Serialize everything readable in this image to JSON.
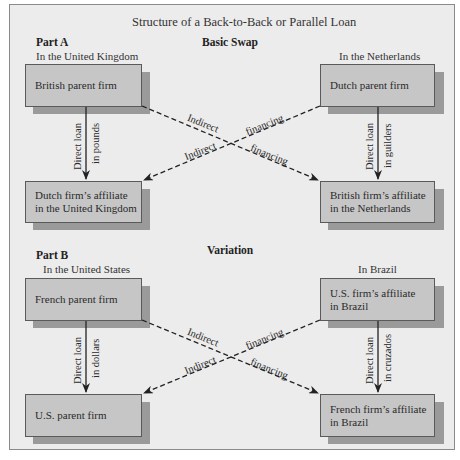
{
  "title": "Structure of a Back-to-Back or Parallel Loan",
  "part_a": {
    "label": "Part A",
    "heading": "Basic Swap",
    "left_location": "In the United Kingdom",
    "right_location": "In the Netherlands",
    "boxes": {
      "top_left": "British parent firm",
      "top_right": "Dutch parent firm",
      "bottom_left_line1": "Dutch firm’s affiliate",
      "bottom_left_line2": "in the United Kingdom",
      "bottom_right_line1": "British firm’s affiliate",
      "bottom_right_line2": "in the Netherlands"
    },
    "left_loan_line1": "Direct loan",
    "left_loan_line2": "in pounds",
    "right_loan_line1": "Direct loan",
    "right_loan_line2": "in guilders",
    "indirect_1": "Indirect",
    "financing_1": "financing",
    "indirect_2": "Indirect",
    "financing_2": "financing"
  },
  "part_b": {
    "label": "Part B",
    "heading": "Variation",
    "left_location": "In the United States",
    "right_location": "In Brazil",
    "boxes": {
      "top_left": "French parent firm",
      "top_right_line1": "U.S. firm’s affiliate",
      "top_right_line2": "in Brazil",
      "bottom_left": "U.S. parent firm",
      "bottom_right_line1": "French firm’s affiliate",
      "bottom_right_line2": "in Brazil"
    },
    "left_loan_line1": "Direct loan",
    "left_loan_line2": "in dollars",
    "right_loan_line1": "Direct loan",
    "right_loan_line2": "in cruzados",
    "indirect_1": "Indirect",
    "financing_1": "financing",
    "indirect_2": "Indirect",
    "financing_2": "financing"
  },
  "colors": {
    "background": "#ececec",
    "box_fill": "#c6c6c6",
    "box_shadow": "#9a9a9a",
    "border": "#5a5a5a"
  }
}
